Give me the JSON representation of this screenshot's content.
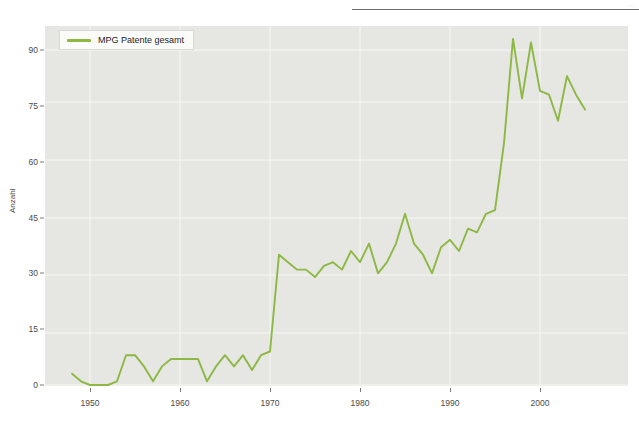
{
  "page": {
    "top_rule_visible": true,
    "header_faint_text": "..."
  },
  "legend": {
    "label": "MPG Patente gesamt",
    "swatch_name": "line-swatch"
  },
  "axes": {
    "ylabel": "Anzahl",
    "yticks": [
      0,
      15,
      30,
      45,
      60,
      75,
      90
    ],
    "xticks": [
      1950,
      1960,
      1970,
      1980,
      1990,
      2000
    ]
  },
  "colors": {
    "line": "#8cb843",
    "plot_background": "#e6e6e3",
    "gridline": "#f7f7f5",
    "tick_text": "#4a4a4a",
    "page_background": "#ffffff"
  },
  "chart_data": {
    "type": "line",
    "title": "",
    "xlabel": "",
    "ylabel": "Anzahl",
    "xlim": [
      1947,
      2006
    ],
    "ylim": [
      0,
      96
    ],
    "grid": true,
    "legend_position": "top-left",
    "series": [
      {
        "name": "MPG Patente gesamt",
        "color": "#8cb843",
        "x": [
          1948,
          1949,
          1950,
          1951,
          1952,
          1953,
          1954,
          1955,
          1956,
          1957,
          1958,
          1959,
          1960,
          1961,
          1962,
          1963,
          1964,
          1965,
          1966,
          1967,
          1968,
          1969,
          1970,
          1971,
          1972,
          1973,
          1974,
          1975,
          1976,
          1977,
          1978,
          1979,
          1980,
          1981,
          1982,
          1983,
          1984,
          1985,
          1986,
          1987,
          1988,
          1989,
          1990,
          1991,
          1992,
          1993,
          1994,
          1995,
          1996,
          1997,
          1998,
          1999,
          2000,
          2001,
          2002,
          2003,
          2004,
          2005
        ],
        "values": [
          3,
          1,
          0,
          0,
          0,
          1,
          8,
          8,
          5,
          1,
          5,
          7,
          7,
          7,
          7,
          1,
          5,
          8,
          5,
          8,
          4,
          8,
          9,
          35,
          33,
          31,
          31,
          29,
          32,
          33,
          31,
          36,
          33,
          38,
          30,
          33,
          38,
          46,
          38,
          35,
          30,
          37,
          39,
          36,
          42,
          41,
          46,
          47,
          65,
          93,
          77,
          92,
          79,
          78,
          71,
          83,
          78,
          74
        ],
        "axis_ranges_note": "values read from gridlines at 0/15/30/45/60/75/90"
      }
    ]
  }
}
